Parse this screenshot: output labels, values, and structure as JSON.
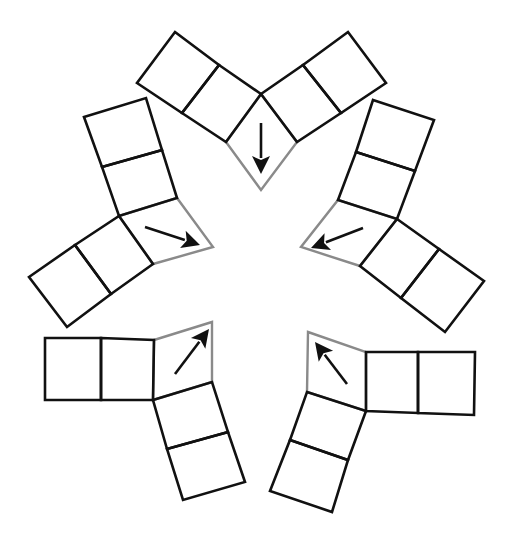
{
  "diagram": {
    "colors": {
      "background": "#ffffff",
      "square_stroke": "#111111",
      "rhombus_stroke": "#8a8a8a",
      "arrow": "#111111"
    },
    "units": [
      {
        "id": "top",
        "arrow_direction": "down",
        "squares": [
          [
            [
              175,
              32
            ],
            [
              219,
              65
            ],
            [
              182,
              113
            ],
            [
              137,
              83
            ]
          ],
          [
            [
              219,
              65
            ],
            [
              261,
              94
            ],
            [
              226,
              142
            ],
            [
              182,
              113
            ]
          ],
          [
            [
              303,
              65
            ],
            [
              348,
              32
            ],
            [
              386,
              83
            ],
            [
              341,
              113
            ]
          ],
          [
            [
              261,
              94
            ],
            [
              303,
              65
            ],
            [
              341,
              113
            ],
            [
              297,
              142
            ]
          ]
        ],
        "rhombus": [
          [
            226,
            142
          ],
          [
            261,
            94
          ],
          [
            297,
            142
          ],
          [
            261,
            190
          ]
        ],
        "arrow": {
          "from": [
            261,
            123
          ],
          "to": [
            261,
            174
          ]
        }
      },
      {
        "id": "upper-left",
        "arrow_direction": "down-right",
        "squares": [
          [
            [
              84,
              117
            ],
            [
              146,
              98
            ],
            [
              162,
              150
            ],
            [
              102,
              167
            ]
          ],
          [
            [
              102,
              167
            ],
            [
              162,
              150
            ],
            [
              177,
              198
            ],
            [
              119,
              216
            ]
          ],
          [
            [
              29,
              277
            ],
            [
              75,
              245
            ],
            [
              111,
              294
            ],
            [
              67,
              327
            ]
          ],
          [
            [
              75,
              245
            ],
            [
              119,
              216
            ],
            [
              153,
              264
            ],
            [
              111,
              294
            ]
          ]
        ],
        "rhombus": [
          [
            119,
            216
          ],
          [
            177,
            198
          ],
          [
            213,
            247
          ],
          [
            153,
            264
          ]
        ],
        "arrow": {
          "from": [
            145,
            227
          ],
          "to": [
            200,
            245
          ]
        }
      },
      {
        "id": "upper-right",
        "arrow_direction": "down-left",
        "squares": [
          [
            [
              373,
              100
            ],
            [
              434,
              120
            ],
            [
              415,
              171
            ],
            [
              356,
              152
            ]
          ],
          [
            [
              356,
              152
            ],
            [
              415,
              171
            ],
            [
              397,
              219
            ],
            [
              338,
              200
            ]
          ],
          [
            [
              397,
              219
            ],
            [
              439,
              249
            ],
            [
              401,
              298
            ],
            [
              360,
              266
            ]
          ],
          [
            [
              439,
              249
            ],
            [
              484,
              281
            ],
            [
              445,
              332
            ],
            [
              401,
              298
            ]
          ]
        ],
        "rhombus": [
          [
            338,
            200
          ],
          [
            397,
            219
          ],
          [
            360,
            266
          ],
          [
            301,
            247
          ]
        ],
        "arrow": {
          "from": [
            363,
            228
          ],
          "to": [
            311,
            248
          ]
        }
      },
      {
        "id": "lower-left",
        "arrow_direction": "up-right",
        "squares": [
          [
            [
              45,
              338
            ],
            [
              101,
              338
            ],
            [
              101,
              400
            ],
            [
              45,
              400
            ]
          ],
          [
            [
              101,
              338
            ],
            [
              154,
              340
            ],
            [
              153,
              400
            ],
            [
              101,
              400
            ]
          ],
          [
            [
              153,
              400
            ],
            [
              212,
              382
            ],
            [
              228,
              432
            ],
            [
              167,
              449
            ]
          ],
          [
            [
              167,
              449
            ],
            [
              228,
              432
            ],
            [
              245,
              482
            ],
            [
              183,
              500
            ]
          ]
        ],
        "rhombus": [
          [
            154,
            340
          ],
          [
            212,
            322
          ],
          [
            212,
            382
          ],
          [
            153,
            400
          ]
        ],
        "arrow": {
          "from": [
            175,
            374
          ],
          "to": [
            209,
            329
          ]
        }
      },
      {
        "id": "lower-right",
        "arrow_direction": "up-left",
        "squares": [
          [
            [
              366,
              352
            ],
            [
              418,
              352
            ],
            [
              418,
              413
            ],
            [
              366,
              411
            ]
          ],
          [
            [
              418,
              352
            ],
            [
              475,
              352
            ],
            [
              474,
              415
            ],
            [
              418,
              413
            ]
          ],
          [
            [
              307,
              392
            ],
            [
              366,
              411
            ],
            [
              348,
              460
            ],
            [
              290,
              440
            ]
          ],
          [
            [
              290,
              440
            ],
            [
              348,
              460
            ],
            [
              332,
              512
            ],
            [
              270,
              491
            ]
          ]
        ],
        "rhombus": [
          [
            308,
            332
          ],
          [
            366,
            352
          ],
          [
            366,
            411
          ],
          [
            307,
            392
          ]
        ],
        "arrow": {
          "from": [
            347,
            384
          ],
          "to": [
            315,
            342
          ]
        }
      }
    ]
  }
}
